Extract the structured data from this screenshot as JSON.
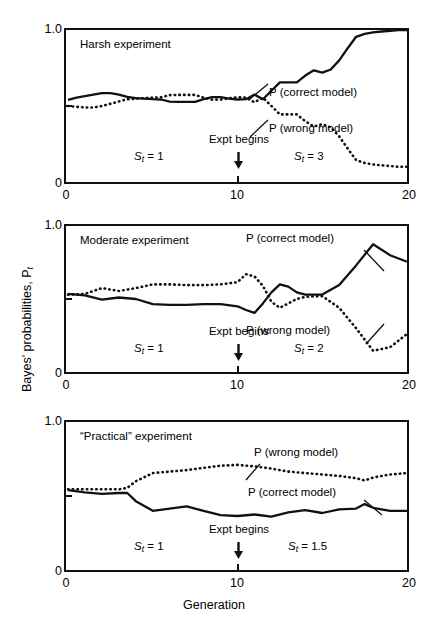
{
  "figure": {
    "y_axis_title": "Bayes' probabilities, P",
    "y_axis_title_sub": "t",
    "x_axis_title": "Generation",
    "y_tick_top": "1.0",
    "y_tick_bottom": "0",
    "x_ticks": [
      "0",
      "10",
      "20"
    ],
    "expt_label": "Expt begins",
    "legend_correct": "P (correct model)",
    "legend_wrong": "P (wrong model)"
  },
  "chart_data": {
    "type": "line",
    "xlabel": "Generation",
    "ylabel": "Bayes' probabilities, P_t",
    "xlim": [
      0,
      20
    ],
    "ylim": [
      0,
      1.0
    ],
    "grid": false,
    "legend_position": "inline-annotation",
    "x_ticks": [
      0,
      10,
      20
    ],
    "y_ticks": [
      0,
      0.5,
      1.0
    ],
    "panels": [
      {
        "name": "harsh",
        "title": "Harsh experiment",
        "regime_before": "S",
        "regime_before_sub": "t",
        "regime_before_value": "= 1",
        "regime_after": "S",
        "regime_after_sub": "t",
        "regime_after_value": "= 3",
        "expt_begins_x": 10,
        "series": [
          {
            "name": "P (correct model)",
            "style": "solid",
            "x": [
              0,
              0.5,
              1,
              1.5,
              2,
              2.5,
              3,
              3.5,
              4,
              4.5,
              5,
              5.5,
              6,
              6.5,
              7,
              7.5,
              8,
              8.5,
              9,
              9.5,
              10,
              10.5,
              11,
              11.5,
              12,
              12.5,
              13,
              13.5,
              14,
              14.5,
              15,
              15.5,
              16,
              16.5,
              17,
              17.5,
              18,
              18.5,
              19,
              19.5,
              20
            ],
            "y": [
              0.54,
              0.555,
              0.565,
              0.575,
              0.585,
              0.585,
              0.575,
              0.56,
              0.552,
              0.548,
              0.545,
              0.543,
              0.528,
              0.527,
              0.527,
              0.527,
              0.545,
              0.558,
              0.558,
              0.548,
              0.543,
              0.545,
              0.575,
              0.545,
              0.6,
              0.655,
              0.655,
              0.655,
              0.7,
              0.735,
              0.72,
              0.74,
              0.8,
              0.88,
              0.955,
              0.975,
              0.985,
              0.99,
              0.995,
              1.0,
              1.0
            ]
          },
          {
            "name": "P (wrong model)",
            "style": "dotted",
            "x": [
              0,
              0.5,
              1,
              1.5,
              2,
              2.5,
              3,
              3.5,
              4,
              4.5,
              5,
              5.5,
              6,
              6.5,
              7,
              7.5,
              8,
              8.5,
              9,
              9.5,
              10,
              10.5,
              11,
              11.5,
              12,
              12.5,
              13,
              13.5,
              14,
              14.5,
              15,
              15.5,
              16,
              16.5,
              17,
              17.5,
              18,
              18.5,
              19,
              19.5,
              20
            ],
            "y": [
              0.5,
              0.495,
              0.49,
              0.49,
              0.5,
              0.515,
              0.53,
              0.545,
              0.548,
              0.552,
              0.555,
              0.557,
              0.572,
              0.573,
              0.573,
              0.573,
              0.555,
              0.542,
              0.542,
              0.552,
              0.557,
              0.555,
              0.525,
              0.555,
              0.5,
              0.445,
              0.445,
              0.445,
              0.4,
              0.365,
              0.38,
              0.36,
              0.3,
              0.22,
              0.145,
              0.125,
              0.115,
              0.11,
              0.105,
              0.1,
              0.1
            ]
          }
        ]
      },
      {
        "name": "moderate",
        "title": "Moderate experiment",
        "regime_before": "S",
        "regime_before_sub": "t",
        "regime_before_value": "= 1",
        "regime_after": "S",
        "regime_after_sub": "t",
        "regime_after_value": "= 2",
        "expt_begins_x": 10,
        "series": [
          {
            "name": "P (correct model)",
            "style": "solid",
            "x": [
              0,
              1,
              2,
              3,
              4,
              5,
              6,
              7,
              8,
              9,
              10,
              10.5,
              11,
              11.5,
              12,
              12.5,
              13,
              13.5,
              14,
              15,
              16,
              17,
              18,
              19,
              20
            ],
            "y": [
              0.535,
              0.525,
              0.495,
              0.51,
              0.5,
              0.465,
              0.46,
              0.46,
              0.465,
              0.465,
              0.45,
              0.425,
              0.405,
              0.47,
              0.545,
              0.6,
              0.585,
              0.545,
              0.53,
              0.53,
              0.595,
              0.73,
              0.875,
              0.8,
              0.755
            ]
          },
          {
            "name": "P (wrong model)",
            "style": "dotted",
            "x": [
              0,
              1,
              2,
              3,
              4,
              5,
              6,
              7,
              8,
              9,
              10,
              10.5,
              11,
              11.5,
              12,
              12.5,
              13,
              13.5,
              14,
              15,
              16,
              17,
              18,
              19,
              20
            ],
            "y": [
              0.53,
              0.535,
              0.575,
              0.555,
              0.575,
              0.6,
              0.6,
              0.595,
              0.595,
              0.6,
              0.615,
              0.67,
              0.655,
              0.59,
              0.48,
              0.44,
              0.47,
              0.5,
              0.515,
              0.52,
              0.44,
              0.3,
              0.145,
              0.17,
              0.26
            ]
          }
        ]
      },
      {
        "name": "practical",
        "title": "“Practical” experiment",
        "regime_before": "S",
        "regime_before_sub": "t",
        "regime_before_value": "= 1",
        "regime_after": "S",
        "regime_after_sub": "t",
        "regime_after_value": "= 1.5",
        "expt_begins_x": 10,
        "series": [
          {
            "name": "P (correct model)",
            "style": "solid",
            "x": [
              0,
              1,
              2,
              3,
              3.5,
              4,
              5,
              6,
              7,
              8,
              9,
              10,
              11,
              12,
              13,
              14,
              15,
              16,
              17,
              17.5,
              18,
              19,
              20
            ],
            "y": [
              0.54,
              0.525,
              0.515,
              0.52,
              0.52,
              0.465,
              0.4,
              0.415,
              0.43,
              0.4,
              0.37,
              0.365,
              0.375,
              0.36,
              0.39,
              0.405,
              0.385,
              0.41,
              0.415,
              0.445,
              0.42,
              0.4,
              0.4
            ]
          },
          {
            "name": "P (wrong model)",
            "style": "dotted",
            "x": [
              0,
              1,
              2,
              3,
              3.5,
              4,
              5,
              6,
              7,
              8,
              9,
              10,
              11,
              12,
              13,
              14,
              15,
              16,
              17,
              17.5,
              18,
              19,
              20
            ],
            "y": [
              0.545,
              0.545,
              0.545,
              0.545,
              0.555,
              0.6,
              0.655,
              0.665,
              0.675,
              0.69,
              0.705,
              0.71,
              0.7,
              0.685,
              0.665,
              0.655,
              0.645,
              0.635,
              0.62,
              0.605,
              0.625,
              0.645,
              0.655
            ]
          }
        ]
      }
    ]
  }
}
